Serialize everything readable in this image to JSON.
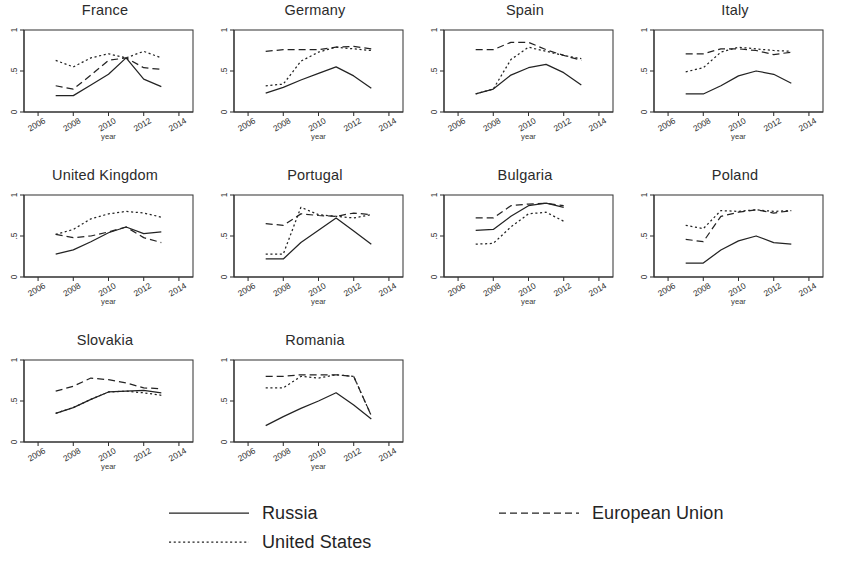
{
  "figure": {
    "background": "#ffffff",
    "ink_color": "#232323",
    "panel_columns": 4,
    "panel_rows": 3
  },
  "axes": {
    "x_label": "year",
    "x_ticks": [
      "2006",
      "2008",
      "2010",
      "2012",
      "2014"
    ],
    "x_tick_values": [
      2006,
      2008,
      2010,
      2012,
      2014
    ],
    "xlim": [
      2005.2,
      2014.8
    ],
    "y_ticks": [
      "0",
      ".5",
      "1"
    ],
    "y_tick_values": [
      0,
      0.5,
      1
    ],
    "ylim": [
      0,
      1
    ],
    "grid": false
  },
  "legend": {
    "position": "bottom",
    "entries": [
      {
        "label": "Russia",
        "style": "solid"
      },
      {
        "label": "European Union",
        "style": "dashed"
      },
      {
        "label": "United States",
        "style": "dotted"
      }
    ]
  },
  "chart_data": {
    "type": "line",
    "title": "",
    "subtitle": "",
    "xlabel": "year",
    "ylabel": "",
    "xlim": [
      2005.2,
      2014.8
    ],
    "ylim": [
      0,
      1
    ],
    "x_ticks": [
      2006,
      2008,
      2010,
      2012,
      2014
    ],
    "y_ticks": [
      0,
      0.5,
      1
    ],
    "grid": false,
    "legend_position": "bottom",
    "small_multiples": true,
    "panels": [
      {
        "title": "France",
        "x": [
          2007,
          2008,
          2009,
          2010,
          2011,
          2012,
          2013
        ],
        "series": [
          {
            "name": "Russia",
            "style": "solid",
            "values": [
              0.2,
              0.2,
              0.33,
              0.46,
              0.66,
              0.4,
              0.31
            ]
          },
          {
            "name": "European Union",
            "style": "dashed",
            "values": [
              0.32,
              0.28,
              0.45,
              0.63,
              0.66,
              0.54,
              0.52
            ]
          },
          {
            "name": "United States",
            "style": "dotted",
            "values": [
              0.63,
              0.55,
              0.66,
              0.71,
              0.66,
              0.74,
              0.66
            ]
          }
        ]
      },
      {
        "title": "Germany",
        "x": [
          2007,
          2008,
          2009,
          2010,
          2011,
          2012,
          2013
        ],
        "series": [
          {
            "name": "Russia",
            "style": "solid",
            "values": [
              0.23,
              0.3,
              0.39,
              0.47,
              0.55,
              0.44,
              0.29
            ]
          },
          {
            "name": "European Union",
            "style": "dashed",
            "values": [
              0.74,
              0.76,
              0.76,
              0.76,
              0.79,
              0.8,
              0.77
            ]
          },
          {
            "name": "United States",
            "style": "dotted",
            "values": [
              0.32,
              0.34,
              0.62,
              0.73,
              0.79,
              0.77,
              0.75
            ]
          }
        ]
      },
      {
        "title": "Spain",
        "x": [
          2007,
          2008,
          2009,
          2010,
          2011,
          2012,
          2013
        ],
        "series": [
          {
            "name": "Russia",
            "style": "solid",
            "values": [
              0.22,
              0.28,
              0.45,
              0.54,
              0.58,
              0.48,
              0.33
            ]
          },
          {
            "name": "European Union",
            "style": "dashed",
            "values": [
              0.76,
              0.76,
              0.85,
              0.85,
              0.76,
              0.69,
              0.63
            ]
          },
          {
            "name": "United States",
            "style": "dotted",
            "values": [
              0.22,
              0.28,
              0.64,
              0.79,
              0.74,
              0.69,
              0.65
            ]
          }
        ]
      },
      {
        "title": "Italy",
        "x": [
          2007,
          2008,
          2009,
          2010,
          2011,
          2012,
          2013
        ],
        "series": [
          {
            "name": "Russia",
            "style": "solid",
            "values": [
              0.22,
              0.22,
              0.32,
              0.44,
              0.5,
              0.46,
              0.35
            ]
          },
          {
            "name": "European Union",
            "style": "dashed",
            "values": [
              0.71,
              0.71,
              0.77,
              0.77,
              0.75,
              0.7,
              0.73
            ]
          },
          {
            "name": "United States",
            "style": "dotted",
            "values": [
              0.49,
              0.54,
              0.73,
              0.79,
              0.77,
              0.75,
              0.74
            ]
          }
        ]
      },
      {
        "title": "United Kingdom",
        "x": [
          2007,
          2008,
          2009,
          2010,
          2011,
          2012,
          2013
        ],
        "series": [
          {
            "name": "Russia",
            "style": "solid",
            "values": [
              0.28,
              0.33,
              0.43,
              0.54,
              0.61,
              0.53,
              0.55
            ]
          },
          {
            "name": "European Union",
            "style": "dashed",
            "values": [
              0.52,
              0.48,
              0.5,
              0.55,
              0.61,
              0.48,
              0.42
            ]
          },
          {
            "name": "United States",
            "style": "dotted",
            "values": [
              0.52,
              0.58,
              0.71,
              0.77,
              0.8,
              0.78,
              0.73
            ]
          }
        ]
      },
      {
        "title": "Portugal",
        "x": [
          2007,
          2008,
          2009,
          2010,
          2011,
          2012,
          2013
        ],
        "series": [
          {
            "name": "Russia",
            "style": "solid",
            "values": [
              0.22,
              0.22,
              0.42,
              0.57,
              0.72,
              0.56,
              0.4
            ]
          },
          {
            "name": "European Union",
            "style": "dashed",
            "values": [
              0.65,
              0.63,
              0.77,
              0.75,
              0.74,
              0.78,
              0.76
            ]
          },
          {
            "name": "United States",
            "style": "dotted",
            "values": [
              0.28,
              0.28,
              0.85,
              0.76,
              0.74,
              0.72,
              0.76
            ]
          }
        ]
      },
      {
        "title": "Bulgaria",
        "x": [
          2007,
          2008,
          2009,
          2010,
          2011,
          2012
        ],
        "series": [
          {
            "name": "Russia",
            "style": "solid",
            "values": [
              0.57,
              0.58,
              0.74,
              0.87,
              0.9,
              0.85
            ]
          },
          {
            "name": "European Union",
            "style": "dashed",
            "values": [
              0.72,
              0.72,
              0.87,
              0.89,
              0.9,
              0.87
            ]
          },
          {
            "name": "United States",
            "style": "dotted",
            "values": [
              0.4,
              0.41,
              0.61,
              0.77,
              0.79,
              0.68
            ]
          }
        ]
      },
      {
        "title": "Poland",
        "x": [
          2007,
          2008,
          2009,
          2010,
          2011,
          2012,
          2013
        ],
        "series": [
          {
            "name": "Russia",
            "style": "solid",
            "values": [
              0.17,
              0.17,
              0.33,
              0.44,
              0.5,
              0.42,
              0.4
            ]
          },
          {
            "name": "European Union",
            "style": "dashed",
            "values": [
              0.46,
              0.43,
              0.74,
              0.79,
              0.82,
              0.78,
              0.81
            ]
          },
          {
            "name": "United States",
            "style": "dotted",
            "values": [
              0.63,
              0.59,
              0.81,
              0.8,
              0.82,
              0.8,
              0.81
            ]
          }
        ]
      },
      {
        "title": "Slovakia",
        "x": [
          2007,
          2008,
          2009,
          2010,
          2011,
          2012,
          2013
        ],
        "series": [
          {
            "name": "Russia",
            "style": "solid",
            "values": [
              0.35,
              0.42,
              0.52,
              0.61,
              0.62,
              0.63,
              0.6
            ]
          },
          {
            "name": "European Union",
            "style": "dashed",
            "values": [
              0.62,
              0.68,
              0.78,
              0.76,
              0.72,
              0.66,
              0.65
            ]
          },
          {
            "name": "United States",
            "style": "dotted",
            "values": [
              0.35,
              0.42,
              0.52,
              0.61,
              0.62,
              0.6,
              0.57
            ]
          }
        ]
      },
      {
        "title": "Romania",
        "x": [
          2007,
          2008,
          2009,
          2010,
          2011,
          2012,
          2013
        ],
        "series": [
          {
            "name": "Russia",
            "style": "solid",
            "values": [
              0.2,
              0.31,
              0.41,
              0.5,
              0.6,
              0.45,
              0.28
            ]
          },
          {
            "name": "European Union",
            "style": "dashed",
            "values": [
              0.8,
              0.8,
              0.82,
              0.82,
              0.82,
              0.8,
              0.32
            ]
          },
          {
            "name": "United States",
            "style": "dotted",
            "values": [
              0.66,
              0.66,
              0.8,
              0.78,
              0.82,
              0.8,
              0.32
            ]
          }
        ]
      }
    ]
  }
}
